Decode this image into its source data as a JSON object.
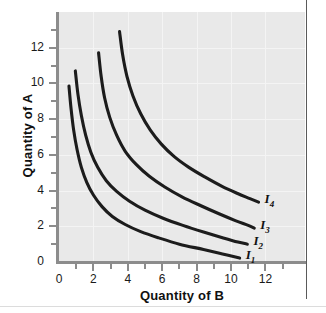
{
  "chart_data": {
    "type": "line",
    "title": "",
    "subtitle": "",
    "xlabel": "Quantity of B",
    "ylabel": "Quantity of A",
    "xlim": [
      0,
      14.3
    ],
    "ylim": [
      0,
      14
    ],
    "xticks": [
      0,
      2,
      4,
      6,
      8,
      10,
      12
    ],
    "yticks": [
      0,
      2,
      4,
      6,
      8,
      10,
      12
    ],
    "xtick_labels": [
      "0",
      "2",
      "4",
      "6",
      "8",
      "10",
      "12"
    ],
    "ytick_labels": [
      "0",
      "2",
      "4",
      "6",
      "8",
      "10",
      "12"
    ],
    "xminor_ticks": [
      1,
      3,
      5,
      7,
      9,
      11,
      13
    ],
    "yminor_ticks": [
      1,
      3,
      5,
      7,
      9,
      11,
      13
    ],
    "grid": true,
    "grid_color": "#f4f4f4",
    "plot_background": "#e9e9e9",
    "axis_color": "#8c8c8c",
    "curve_color": "#1c1c1c",
    "legend_position": "inline-right-of-curve-ends",
    "series": [
      {
        "name": "I1",
        "label": "I",
        "subscript": "1",
        "points": [
          [
            0.58,
            9.85
          ],
          [
            0.7,
            8.6
          ],
          [
            0.85,
            7.4
          ],
          [
            1.05,
            6.3
          ],
          [
            1.3,
            5.3
          ],
          [
            1.62,
            4.45
          ],
          [
            2.0,
            3.75
          ],
          [
            2.5,
            3.1
          ],
          [
            3.1,
            2.55
          ],
          [
            3.85,
            2.1
          ],
          [
            4.75,
            1.7
          ],
          [
            5.8,
            1.35
          ],
          [
            7.0,
            1.0
          ],
          [
            8.4,
            0.7
          ],
          [
            9.5,
            0.45
          ],
          [
            10.5,
            0.22
          ]
        ]
      },
      {
        "name": "I2",
        "label": "I",
        "subscript": "2",
        "points": [
          [
            0.95,
            10.7
          ],
          [
            1.1,
            9.4
          ],
          [
            1.3,
            8.2
          ],
          [
            1.55,
            7.1
          ],
          [
            1.85,
            6.15
          ],
          [
            2.25,
            5.3
          ],
          [
            2.75,
            4.55
          ],
          [
            3.35,
            3.95
          ],
          [
            4.1,
            3.4
          ],
          [
            5.0,
            2.9
          ],
          [
            6.05,
            2.45
          ],
          [
            7.2,
            2.05
          ],
          [
            8.4,
            1.68
          ],
          [
            9.55,
            1.35
          ],
          [
            10.4,
            1.12
          ],
          [
            10.95,
            1.0
          ]
        ]
      },
      {
        "name": "I3",
        "label": "I",
        "subscript": "3",
        "points": [
          [
            2.3,
            11.72
          ],
          [
            2.45,
            10.4
          ],
          [
            2.65,
            9.2
          ],
          [
            2.95,
            8.1
          ],
          [
            3.35,
            7.1
          ],
          [
            3.85,
            6.2
          ],
          [
            4.5,
            5.45
          ],
          [
            5.25,
            4.8
          ],
          [
            6.15,
            4.2
          ],
          [
            7.15,
            3.65
          ],
          [
            8.25,
            3.15
          ],
          [
            9.3,
            2.7
          ],
          [
            10.25,
            2.32
          ],
          [
            11.0,
            2.05
          ],
          [
            11.35,
            1.9
          ]
        ]
      },
      {
        "name": "I4",
        "label": "I",
        "subscript": "4",
        "points": [
          [
            3.52,
            12.9
          ],
          [
            3.7,
            11.6
          ],
          [
            3.95,
            10.4
          ],
          [
            4.3,
            9.3
          ],
          [
            4.75,
            8.3
          ],
          [
            5.3,
            7.4
          ],
          [
            5.95,
            6.6
          ],
          [
            6.7,
            5.9
          ],
          [
            7.55,
            5.3
          ],
          [
            8.5,
            4.75
          ],
          [
            9.45,
            4.25
          ],
          [
            10.35,
            3.85
          ],
          [
            11.1,
            3.55
          ],
          [
            11.6,
            3.35
          ]
        ]
      }
    ],
    "curve_labels": [
      {
        "text": "I",
        "sub": "4",
        "x": 11.95,
        "y": 3.45
      },
      {
        "text": "I",
        "sub": "3",
        "x": 11.7,
        "y": 2.0
      },
      {
        "text": "I",
        "sub": "2",
        "x": 11.3,
        "y": 1.1
      },
      {
        "text": "I",
        "sub": "1",
        "x": 10.85,
        "y": 0.35
      }
    ]
  }
}
